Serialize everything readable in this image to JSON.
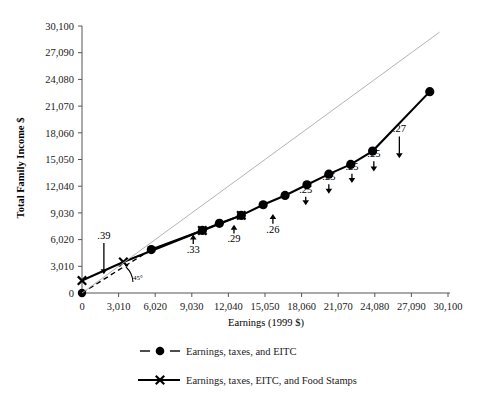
{
  "chart_data": {
    "type": "line",
    "title": "",
    "xlabel": "Earnings (1999 $)",
    "ylabel": "Total Family Income $",
    "xlim": [
      0,
      30100
    ],
    "ylim": [
      0,
      30100
    ],
    "grid": false,
    "legend_position": "bottom",
    "xticks": [
      "0",
      "3,010",
      "6,020",
      "9,030",
      "12,040",
      "15,050",
      "18,060",
      "21,070",
      "24,080",
      "27,090",
      "30,100"
    ],
    "yticks": [
      "0",
      "3,010",
      "6,020",
      "9,030",
      "12,040",
      "15,050",
      "18,060",
      "21,070",
      "24,080",
      "27,090",
      "30,100"
    ],
    "xtick_values": [
      0,
      3010,
      6020,
      9030,
      12040,
      15050,
      18060,
      21070,
      24080,
      27090,
      30100
    ],
    "ytick_values": [
      0,
      3010,
      6020,
      9030,
      12040,
      15050,
      18060,
      21070,
      24080,
      27090,
      30100
    ],
    "series": [
      {
        "name": "Earnings, taxes, and EITC",
        "marker": "filled-circle",
        "linestyle": "dashed-then-solid",
        "color": "#000000",
        "points": [
          {
            "x": 0,
            "y": 0
          },
          {
            "x": 5700,
            "y": 4900
          },
          {
            "x": 9900,
            "y": 7050
          },
          {
            "x": 11300,
            "y": 7850
          },
          {
            "x": 13100,
            "y": 8750
          },
          {
            "x": 14900,
            "y": 9950
          },
          {
            "x": 16700,
            "y": 11000
          },
          {
            "x": 18500,
            "y": 12200
          },
          {
            "x": 20300,
            "y": 13400
          },
          {
            "x": 22100,
            "y": 14500
          },
          {
            "x": 23900,
            "y": 16000
          },
          {
            "x": 28600,
            "y": 22700
          }
        ]
      },
      {
        "name": "Earnings, taxes, EITC, and Food Stamps",
        "marker": "x-cross",
        "linestyle": "solid",
        "color": "#000000",
        "points": [
          {
            "x": 0,
            "y": 1400
          },
          {
            "x": 3400,
            "y": 3500
          },
          {
            "x": 9900,
            "y": 7050
          },
          {
            "x": 13100,
            "y": 8750
          }
        ]
      },
      {
        "name": "45-degree reference line",
        "marker": "none",
        "linestyle": "thin-solid",
        "color": "#aaaaaa",
        "points": [
          {
            "x": 0,
            "y": 0
          },
          {
            "x": 29400,
            "y": 29400
          }
        ]
      }
    ],
    "annotations": [
      {
        "label": ".39",
        "x": 1800,
        "y": 6100,
        "arrow": "down",
        "arrow_to_y": 2100
      },
      {
        "label": "45°",
        "x": 4600,
        "y": 1450,
        "arrow": "none"
      },
      {
        "label": ".33",
        "x": 9150,
        "y": 4500,
        "arrow": "up",
        "arrow_to_y": 6600
      },
      {
        "label": ".29",
        "x": 12500,
        "y": 5700,
        "arrow": "up",
        "arrow_to_y": 7700
      },
      {
        "label": ".26",
        "x": 15700,
        "y": 6800,
        "arrow": "up",
        "arrow_to_y": 8900
      },
      {
        "label": ".25",
        "x": 18400,
        "y": 11300,
        "arrow": "down",
        "arrow_to_y": 9900
      },
      {
        "label": ".25",
        "x": 20300,
        "y": 12700,
        "arrow": "down",
        "arrow_to_y": 11200
      },
      {
        "label": ".25",
        "x": 22200,
        "y": 13900,
        "arrow": "down",
        "arrow_to_y": 12400
      },
      {
        "label": ".25",
        "x": 24000,
        "y": 15300,
        "arrow": "down",
        "arrow_to_y": 13700
      },
      {
        "label": ".27",
        "x": 26100,
        "y": 18100,
        "arrow": "down",
        "arrow_to_y": 15200
      }
    ],
    "legend": [
      {
        "label": "Earnings, taxes, and EITC",
        "marker": "filled-circle",
        "linestyle": "dashed"
      },
      {
        "label": "Earnings, taxes, EITC, and Food Stamps",
        "marker": "x-cross",
        "linestyle": "solid"
      }
    ]
  }
}
